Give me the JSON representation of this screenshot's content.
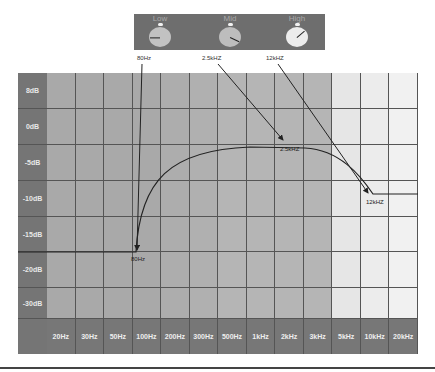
{
  "eq_panel": {
    "knobs": [
      {
        "label": "Low",
        "freq_label": "80Hz",
        "knob_color": "#c2c2c2",
        "angle_deg": 180
      },
      {
        "label": "Mid",
        "freq_label": "2.5kHZ",
        "knob_color": "#bdbdbd",
        "angle_deg": 25
      },
      {
        "label": "High",
        "freq_label": "12kHZ",
        "knob_color": "#ececec",
        "angle_deg": -40
      }
    ],
    "panel_color": "#6e6e6e"
  },
  "chart": {
    "y_labels": [
      "8dB",
      "0dB",
      "-5dB",
      "-10dB",
      "-15dB",
      "-20dB",
      "-30dB"
    ],
    "x_labels": [
      "20Hz",
      "30Hz",
      "50Hz",
      "100Hz",
      "200Hz",
      "300Hz",
      "500Hz",
      "1kHz",
      "2kHz",
      "3kHz",
      "5kHz",
      "10kHz",
      "20kHz"
    ],
    "column_shades": [
      "#a9a9a9",
      "#a9a9a9",
      "#a9a9a9",
      "#a9a9a9",
      "#adadad",
      "#b0b0b0",
      "#b5b5b5",
      "#b5b5b5",
      "#b5b5b5",
      "#b5b5b5",
      "#e6e6e6",
      "#ececec",
      "#f1f1f1"
    ],
    "annotations": {
      "low_point": "80Hz",
      "mid_point": "2.5kHZ",
      "high_point": "12kHZ"
    }
  },
  "chart_data": {
    "type": "line",
    "xlabel": "Frequency",
    "ylabel": "Gain",
    "categories": [
      "20Hz",
      "30Hz",
      "50Hz",
      "100Hz",
      "200Hz",
      "300Hz",
      "500Hz",
      "1kHz",
      "2kHz",
      "3kHz",
      "5kHz",
      "10kHz",
      "20kHz"
    ],
    "y_ticks": [
      "8dB",
      "0dB",
      "-5dB",
      "-10dB",
      "-15dB",
      "-20dB",
      "-30dB"
    ],
    "series": [
      {
        "name": "EQ curve",
        "points": [
          {
            "x": "20Hz",
            "y": -17
          },
          {
            "x": "80Hz",
            "y": -17
          },
          {
            "x": "200Hz",
            "y": -7
          },
          {
            "x": "500Hz",
            "y": -4
          },
          {
            "x": "2.5kHz",
            "y": -4
          },
          {
            "x": "5kHz",
            "y": -6
          },
          {
            "x": "12kHz",
            "y": -10
          },
          {
            "x": "20kHz",
            "y": -10
          }
        ]
      }
    ],
    "annotations": [
      "80Hz",
      "2.5kHZ",
      "12kHZ"
    ],
    "grid": true
  }
}
